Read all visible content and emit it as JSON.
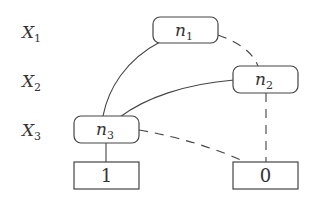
{
  "diagram": {
    "type": "binary decision diagram",
    "levels": [
      {
        "var": "X",
        "sub": "1"
      },
      {
        "var": "X",
        "sub": "2"
      },
      {
        "var": "X",
        "sub": "3"
      }
    ],
    "nodes": [
      {
        "id": "n1",
        "var": "n",
        "sub": "1"
      },
      {
        "id": "n2",
        "var": "n",
        "sub": "2"
      },
      {
        "id": "n3",
        "var": "n",
        "sub": "3"
      }
    ],
    "terminals": [
      {
        "id": "t1",
        "label": "1"
      },
      {
        "id": "t0",
        "label": "0"
      }
    ],
    "edges": [
      {
        "from": "n1",
        "to": "n3",
        "style": "solid"
      },
      {
        "from": "n1",
        "to": "n2",
        "style": "dashed"
      },
      {
        "from": "n2",
        "to": "n3",
        "style": "solid"
      },
      {
        "from": "n2",
        "to": "t0",
        "style": "dashed"
      },
      {
        "from": "n3",
        "to": "t1",
        "style": "solid"
      },
      {
        "from": "n3",
        "to": "t0",
        "style": "dashed"
      }
    ]
  }
}
